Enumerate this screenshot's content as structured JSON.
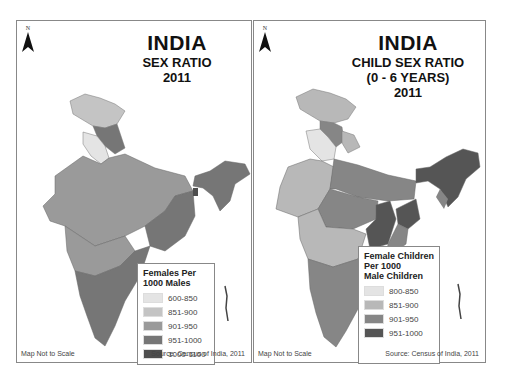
{
  "maps": [
    {
      "title": "INDIA",
      "subtitle_lines": [
        "SEX RATIO",
        "2011"
      ],
      "north_label": "N",
      "legend": {
        "title_lines": [
          "Females Per",
          "1000 Males"
        ],
        "items": [
          {
            "label": "600-850",
            "color": "#e4e4e4"
          },
          {
            "label": "851-900",
            "color": "#c4c4c4"
          },
          {
            "label": "901-950",
            "color": "#9a9a9a"
          },
          {
            "label": "951-1000",
            "color": "#767676"
          },
          {
            "label": "1000-1100",
            "color": "#4e4e4e"
          }
        ]
      },
      "footer_left": "Map Not to Scale",
      "footer_right": "Source: Census of India, 2011"
    },
    {
      "title": "INDIA",
      "subtitle_lines": [
        "CHILD SEX RATIO",
        "(0 - 6 YEARS)",
        "2011"
      ],
      "north_label": "N",
      "legend": {
        "title_lines": [
          "Female Children",
          "Per 1000",
          "Male Children"
        ],
        "items": [
          {
            "label": "800-850",
            "color": "#e4e4e4"
          },
          {
            "label": "851-900",
            "color": "#b8b8b8"
          },
          {
            "label": "901-950",
            "color": "#868686"
          },
          {
            "label": "951-1000",
            "color": "#555555"
          }
        ]
      },
      "footer_left": "Map Not to Scale",
      "footer_right": "Source: Census of India, 2011"
    }
  ]
}
